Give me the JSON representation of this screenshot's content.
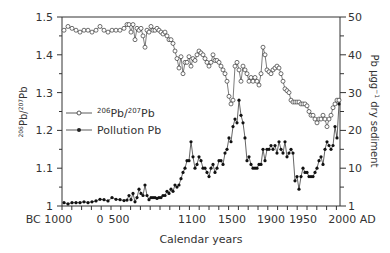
{
  "chart_data": {
    "type": "line",
    "title": "",
    "xlabel": "Calendar years",
    "ylabel_left": "206Pb/207Pb",
    "ylabel_right": "Pb µgg-1 dry sediment",
    "x_tick_labels": [
      "BC 1000",
      "0",
      "500",
      "1100",
      "1500",
      "1900",
      "1950",
      "2000 AD"
    ],
    "y_left_ticks": [
      "1",
      "1.1",
      "1.2",
      "1.3",
      "1.4",
      "1.5"
    ],
    "y_left_range": [
      1,
      1.5
    ],
    "y_right_ticks": [
      "1",
      "10",
      "20",
      "30",
      "40",
      "50"
    ],
    "y_right_range": [
      1,
      50
    ],
    "grid": false,
    "legend_position": "inside-left-middle",
    "series": [
      {
        "name": "206Pb/207Pb",
        "marker": "open-circle",
        "axis": "left",
        "x_px": [
          64,
          68,
          72,
          76,
          80,
          84,
          88,
          92,
          96,
          100,
          104,
          108,
          112,
          116,
          120,
          124,
          127,
          129,
          131,
          133,
          135,
          137,
          139,
          141,
          143,
          145,
          147,
          149,
          151,
          153,
          155,
          157,
          159,
          161,
          163,
          165,
          167,
          169,
          171,
          173,
          175,
          177,
          179,
          181,
          183,
          185,
          187,
          189,
          191,
          193,
          195,
          197,
          199,
          201,
          203,
          205,
          207,
          209,
          211,
          213,
          215,
          217,
          219,
          221,
          223,
          225,
          227,
          229,
          231,
          233,
          235,
          237,
          239,
          241,
          243,
          245,
          247,
          249,
          251,
          253,
          255,
          257,
          259,
          261,
          263,
          265,
          267,
          269,
          271,
          273,
          275,
          277,
          279,
          281,
          283,
          285,
          287,
          289,
          291,
          293,
          295,
          297,
          299,
          301,
          303,
          305,
          307,
          309,
          311,
          313,
          315,
          317,
          319,
          321,
          323,
          325,
          327,
          329,
          331,
          333,
          335,
          337,
          339
        ],
        "values": [
          1.465,
          1.475,
          1.47,
          1.465,
          1.46,
          1.465,
          1.465,
          1.46,
          1.465,
          1.475,
          1.465,
          1.46,
          1.465,
          1.465,
          1.465,
          1.47,
          1.48,
          1.48,
          1.46,
          1.48,
          1.44,
          1.47,
          1.465,
          1.47,
          1.45,
          1.42,
          1.465,
          1.46,
          1.475,
          1.465,
          1.465,
          1.47,
          1.465,
          1.46,
          1.455,
          1.46,
          1.45,
          1.44,
          1.44,
          1.43,
          1.41,
          1.39,
          1.365,
          1.395,
          1.35,
          1.38,
          1.38,
          1.395,
          1.37,
          1.39,
          1.385,
          1.4,
          1.41,
          1.405,
          1.4,
          1.39,
          1.38,
          1.37,
          1.38,
          1.4,
          1.385,
          1.385,
          1.38,
          1.37,
          1.36,
          1.35,
          1.33,
          1.29,
          1.27,
          1.28,
          1.37,
          1.38,
          1.36,
          1.33,
          1.37,
          1.36,
          1.35,
          1.33,
          1.34,
          1.33,
          1.34,
          1.33,
          1.32,
          1.35,
          1.42,
          1.4,
          1.36,
          1.355,
          1.35,
          1.36,
          1.365,
          1.37,
          1.365,
          1.35,
          1.33,
          1.31,
          1.305,
          1.3,
          1.28,
          1.275,
          1.275,
          1.275,
          1.275,
          1.27,
          1.27,
          1.27,
          1.265,
          1.25,
          1.24,
          1.24,
          1.23,
          1.22,
          1.23,
          1.23,
          1.24,
          1.23,
          1.21,
          1.23,
          1.24,
          1.26,
          1.27,
          1.28,
          1.28
        ]
      },
      {
        "name": "Pollution Pb",
        "marker": "filled-circle",
        "axis": "right",
        "x_px": [
          64,
          68,
          72,
          76,
          80,
          84,
          88,
          92,
          96,
          100,
          104,
          108,
          112,
          116,
          120,
          124,
          127,
          129,
          131,
          133,
          135,
          137,
          139,
          141,
          143,
          145,
          147,
          149,
          151,
          153,
          155,
          157,
          159,
          161,
          163,
          165,
          167,
          169,
          171,
          173,
          175,
          177,
          179,
          181,
          183,
          185,
          187,
          189,
          191,
          193,
          195,
          197,
          199,
          201,
          203,
          205,
          207,
          209,
          211,
          213,
          215,
          217,
          219,
          221,
          223,
          225,
          227,
          229,
          231,
          233,
          235,
          237,
          239,
          241,
          243,
          245,
          247,
          249,
          251,
          253,
          255,
          257,
          259,
          261,
          263,
          265,
          267,
          269,
          271,
          273,
          275,
          277,
          279,
          281,
          283,
          285,
          287,
          289,
          291,
          293,
          295,
          297,
          299,
          301,
          303,
          305,
          307,
          309,
          311,
          313,
          315,
          317,
          319,
          321,
          323,
          325,
          327,
          329,
          331,
          333,
          335,
          337,
          339
        ],
        "values": [
          1.8,
          1.5,
          1.8,
          1.8,
          1.8,
          2,
          1.8,
          2,
          2.2,
          2.6,
          2.5,
          2.2,
          3,
          2.6,
          2.5,
          2.3,
          2.4,
          3.5,
          2.5,
          4,
          2,
          3,
          5,
          4,
          3.5,
          6,
          3.5,
          2.5,
          3,
          3,
          3,
          2.8,
          3,
          3,
          3.5,
          3.5,
          4.5,
          4,
          5,
          4.5,
          6,
          5.5,
          6,
          7.5,
          9,
          10,
          12,
          12,
          17,
          13,
          10,
          11,
          13,
          12,
          10,
          10,
          9,
          8,
          10,
          11,
          9,
          10,
          12,
          12,
          11,
          14,
          15,
          18,
          17,
          21,
          23,
          22,
          28,
          24,
          22,
          18,
          12,
          13,
          11,
          10,
          10,
          10,
          11,
          11,
          15,
          12,
          15,
          15,
          16,
          15,
          16,
          14,
          17,
          15,
          14,
          17,
          13,
          14,
          15,
          14,
          7,
          8,
          5,
          8,
          10,
          9,
          9,
          8,
          8,
          8,
          9,
          10,
          12,
          13,
          11,
          15,
          17,
          16,
          15,
          16,
          21,
          18,
          27
        ]
      }
    ]
  },
  "legend": {
    "items": [
      {
        "label_base": "Pb/",
        "label": "206Pb/207Pb"
      },
      {
        "label": "Pollution Pb"
      }
    ]
  },
  "axes": {
    "x_label": "Calendar years",
    "left_label_sup1": "206",
    "left_label_base1": "Pb/",
    "left_label_sup2": "207",
    "left_label_base2": "Pb",
    "right_label": "Pb µgg",
    "right_label_sup": "−1",
    "right_label_tail": " dry sediment"
  }
}
